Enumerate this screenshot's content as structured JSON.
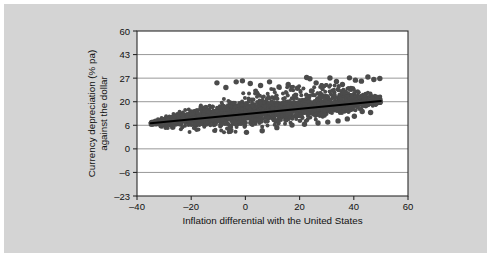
{
  "figure": {
    "panel_background": "#d4d4d4",
    "plot_background": "#ffffff",
    "outer_background": "#ffffff"
  },
  "chart_data": {
    "type": "scatter",
    "title": "",
    "xlabel": "Inflation differential with the United States",
    "ylabel": "Currency depreciation (% pa) against the dollar",
    "ylabel_line1": "Currency depreciation (% pa)",
    "ylabel_line2": "against the dollar",
    "xlim": [
      -40,
      60
    ],
    "ylim": [
      -23,
      60
    ],
    "xticks": [
      -40,
      -20,
      0,
      20,
      40,
      60
    ],
    "xtick_labels": [
      "–40",
      "–20",
      "0",
      "20",
      "40",
      "60"
    ],
    "yticks": [
      -23,
      -6,
      0,
      6,
      20,
      27,
      43,
      60
    ],
    "ytick_labels": [
      "–23",
      "–6",
      "0",
      "6",
      "20",
      "27",
      "43",
      "60"
    ],
    "grid": true,
    "grid_axis": "y",
    "legend": false,
    "marker_color": "#4b4b4b",
    "marker_size": 2.0,
    "trend_line": {
      "color": "#000000",
      "x_start": -35,
      "y_start": 7.2,
      "x_end": 50,
      "y_end": 20.2,
      "slope": 0.153,
      "intercept": 12.55
    },
    "n_points": 2600,
    "series": [
      {
        "name": "Country-year observations",
        "x": [
          -35,
          -34,
          -33,
          -32,
          -31,
          -30,
          -28,
          -26,
          -24,
          -22,
          -20,
          -18,
          -16,
          -14,
          -12,
          -10,
          -8,
          -6,
          -4,
          -2,
          0,
          2,
          4,
          6,
          8,
          10,
          12,
          14,
          16,
          18,
          20,
          22,
          24,
          26,
          28,
          30,
          32,
          34,
          36,
          38,
          40,
          42,
          44,
          46,
          48,
          50
        ],
        "y_mean": [
          7.4,
          7.5,
          7.6,
          7.8,
          8.0,
          8.2,
          8.6,
          9.0,
          9.4,
          9.8,
          10.2,
          10.6,
          11.0,
          11.4,
          11.8,
          12.2,
          12.5,
          12.8,
          13.1,
          13.4,
          13.7,
          14.0,
          14.3,
          14.5,
          14.8,
          15.0,
          15.3,
          15.5,
          15.8,
          16.0,
          16.3,
          16.6,
          16.9,
          17.2,
          17.5,
          17.8,
          18.1,
          18.4,
          18.7,
          19.0,
          19.3,
          19.5,
          19.7,
          19.9,
          20.0,
          20.2
        ],
        "y_spread": [
          0.9,
          1.1,
          1.4,
          1.7,
          2.0,
          2.4,
          3.0,
          3.6,
          4.1,
          4.6,
          5.1,
          5.5,
          5.9,
          6.3,
          6.6,
          6.9,
          7.1,
          7.3,
          7.5,
          7.6,
          7.7,
          7.7,
          7.7,
          7.6,
          7.6,
          7.5,
          7.5,
          7.4,
          7.3,
          7.2,
          7.1,
          7.0,
          6.8,
          6.6,
          6.4,
          6.1,
          5.8,
          5.4,
          5.0,
          4.5,
          4.0,
          3.4,
          2.8,
          2.2,
          1.7,
          1.2
        ]
      }
    ],
    "outliers": [
      {
        "x": -10.5,
        "y": 25.6
      },
      {
        "x": -7.2,
        "y": 24.2
      },
      {
        "x": -3.4,
        "y": 25.9
      },
      {
        "x": -1.1,
        "y": 26.2
      },
      {
        "x": 1.8,
        "y": 25.4
      },
      {
        "x": 5.6,
        "y": 24.8
      },
      {
        "x": 8.9,
        "y": 25.9
      },
      {
        "x": 12.4,
        "y": 24.4
      },
      {
        "x": 15.8,
        "y": 25.1
      },
      {
        "x": 19.2,
        "y": 24.0
      },
      {
        "x": 22.6,
        "y": 27.4
      },
      {
        "x": 23.8,
        "y": 26.8
      },
      {
        "x": 26.1,
        "y": 25.6
      },
      {
        "x": 28.4,
        "y": 24.6
      },
      {
        "x": 31.2,
        "y": 27.1
      },
      {
        "x": 33.6,
        "y": 26.0
      },
      {
        "x": 35.8,
        "y": 25.1
      },
      {
        "x": 38.4,
        "y": 27.2
      },
      {
        "x": 40.6,
        "y": 26.4
      },
      {
        "x": 42.8,
        "y": 26.1
      },
      {
        "x": 45.2,
        "y": 27.8
      },
      {
        "x": 47.4,
        "y": 26.6
      },
      {
        "x": 49.6,
        "y": 26.9
      },
      {
        "x": 43.1,
        "y": 14.2
      },
      {
        "x": 46.2,
        "y": 13.6
      },
      {
        "x": 40.2,
        "y": 11.4
      },
      {
        "x": 37.6,
        "y": 9.8
      },
      {
        "x": 34.2,
        "y": 8.6
      },
      {
        "x": 30.4,
        "y": 7.9
      },
      {
        "x": 26.8,
        "y": 7.4
      },
      {
        "x": 21.8,
        "y": 6.6
      },
      {
        "x": 17.2,
        "y": 6.1
      },
      {
        "x": 11.6,
        "y": 5.4
      },
      {
        "x": 6.2,
        "y": 4.6
      },
      {
        "x": 0.4,
        "y": 4.2
      },
      {
        "x": -5.8,
        "y": 4.8
      },
      {
        "x": 44.8,
        "y": 18.2
      },
      {
        "x": 48.2,
        "y": 19.6
      },
      {
        "x": 36.4,
        "y": 22.8
      },
      {
        "x": 24.4,
        "y": 23.2
      }
    ]
  }
}
